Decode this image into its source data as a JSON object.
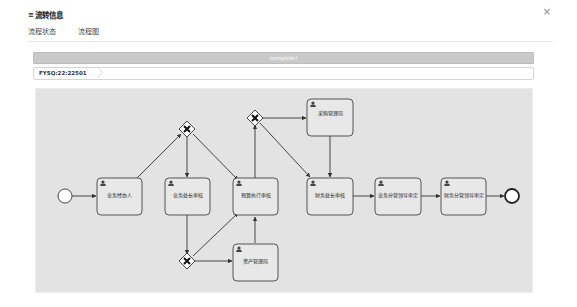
{
  "dialog": {
    "title_icon": "list-icon",
    "title": "流转信息",
    "close_icon": "×"
  },
  "tabs": [
    {
      "label": "流程状态",
      "active": false
    },
    {
      "label": "流程图",
      "active": true
    }
  ],
  "status": {
    "text": "complete!",
    "color": "#c9c9c9"
  },
  "breadcrumb": {
    "items": [
      "FYSQ:22:22501"
    ]
  },
  "diagram": {
    "background": "#e3e3e3",
    "events": [
      {
        "id": "start",
        "type": "start-event"
      },
      {
        "id": "end",
        "type": "end-event"
      }
    ],
    "gateways": [
      {
        "id": "gw1",
        "type": "exclusive-gateway"
      },
      {
        "id": "gw2",
        "type": "exclusive-gateway"
      },
      {
        "id": "gw3",
        "type": "exclusive-gateway"
      }
    ],
    "tasks": [
      {
        "id": "t1",
        "label": "业务经办人",
        "icon": "user-icon"
      },
      {
        "id": "t2",
        "label": "业务处长审核",
        "icon": "user-icon"
      },
      {
        "id": "t3",
        "label": "预算执行审核",
        "icon": "user-icon"
      },
      {
        "id": "t4",
        "label": "资产管理岗",
        "icon": "user-icon"
      },
      {
        "id": "t5",
        "label": "采购管理岗",
        "icon": "user-icon"
      },
      {
        "id": "t6",
        "label": "财务处长审核",
        "icon": "user-icon"
      },
      {
        "id": "t7",
        "label": "业务分管领导审定",
        "icon": "user-icon"
      },
      {
        "id": "t8",
        "label": "财务分管领导审定",
        "icon": "user-icon"
      }
    ]
  }
}
